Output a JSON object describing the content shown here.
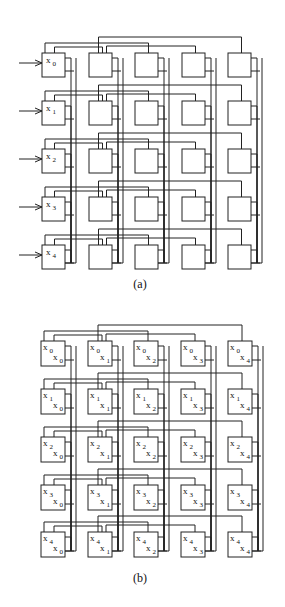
{
  "figure_a": {
    "caption": "(a)",
    "rows": 5,
    "cols": 5,
    "col_x": [
      42,
      89,
      135,
      182,
      228
    ],
    "row_y": [
      53,
      101,
      149,
      197,
      245
    ],
    "box_w": 23,
    "box_h": 24,
    "input_labels": [
      "x0",
      "x1",
      "x2",
      "x3",
      "x4"
    ],
    "input_arrows": true
  },
  "figure_b": {
    "caption": "(b)",
    "rows": 5,
    "cols": 5,
    "col_x": [
      41,
      88,
      134,
      181,
      228
    ],
    "row_y": [
      341,
      389,
      437,
      485,
      532
    ],
    "box_w": 24,
    "box_h": 25,
    "cell_labels": "top-left x_row, bottom-right x_col"
  },
  "colors": {
    "line": "#222222",
    "background": "#ffffff"
  }
}
